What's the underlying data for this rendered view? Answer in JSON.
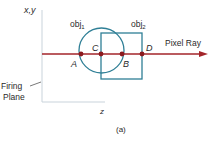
{
  "diagram": {
    "axis_label_vertical": "x,y",
    "axis_label_horizontal": "z",
    "firing_plane_label_line1": "Firing",
    "firing_plane_label_line2": "Plane",
    "ray_label": "Pixel Ray",
    "caption": "(a)",
    "objects": [
      {
        "name": "obj",
        "subscript": "1",
        "shape": "circle"
      },
      {
        "name": "obj",
        "subscript": "2",
        "shape": "rectangle"
      }
    ],
    "points": [
      {
        "label": "A"
      },
      {
        "label": "C"
      },
      {
        "label": "B"
      },
      {
        "label": "D"
      }
    ],
    "colors": {
      "ray": "#a3252a",
      "point": "#8b1a1f",
      "shape": "#2f7f96",
      "axis": "#c9d3db",
      "text": "#2a2a2a"
    }
  }
}
